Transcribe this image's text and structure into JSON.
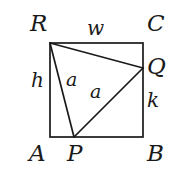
{
  "figure": {
    "kind": "geometry-diagram",
    "stroke_color": "#1a1a1a",
    "background_color": "#ffffff",
    "stroke_width": 1.6
  },
  "vertices": {
    "R": "R",
    "C": "C",
    "A": "A",
    "B": "B",
    "P": "P",
    "Q": "Q"
  },
  "segment_labels": {
    "w": "w",
    "h": "h",
    "k": "k",
    "a1": "a",
    "a2": "a"
  },
  "geometry": {
    "square": {
      "left": 50,
      "top": 43,
      "right": 143,
      "bottom": 137
    },
    "points": {
      "R": [
        50,
        43
      ],
      "C": [
        143,
        43
      ],
      "A": [
        50,
        137
      ],
      "B": [
        143,
        137
      ],
      "P": [
        74,
        137
      ],
      "Q": [
        143,
        68
      ]
    },
    "triangle": [
      "R",
      "Q",
      "P"
    ]
  }
}
